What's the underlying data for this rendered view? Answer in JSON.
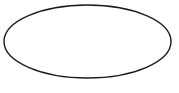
{
  "canvas": {
    "width": 179,
    "height": 93,
    "background_color": "#ffffff"
  },
  "shapes": [
    {
      "name": "ellipse",
      "type": "ellipse",
      "cx": 87.5,
      "cy": 41.5,
      "rx": 83.5,
      "ry": 36.5,
      "stroke_color": "#1c1c1c",
      "stroke_width": 1.4,
      "fill": "none"
    }
  ]
}
